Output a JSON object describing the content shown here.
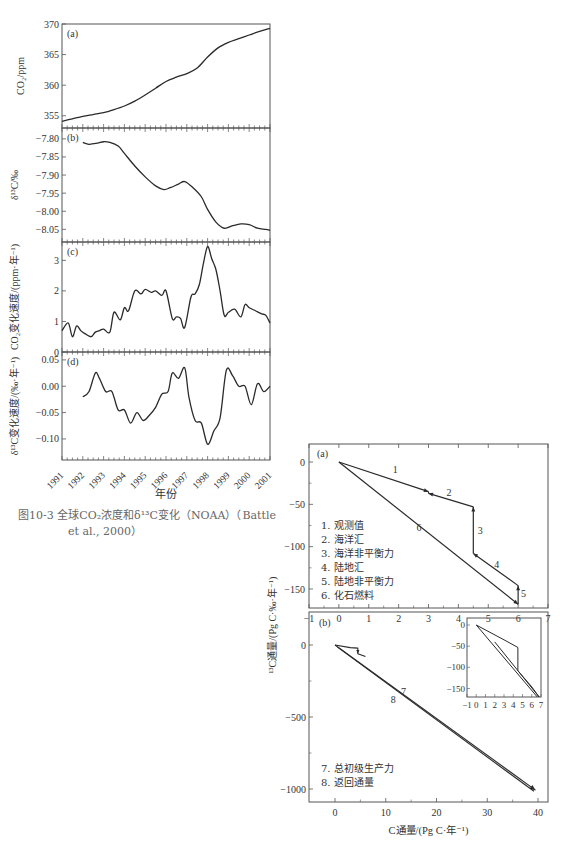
{
  "figure_caption": {
    "line1": "图10-3  全球CO₂浓度和δ¹³C变化（NOAA）（Battle",
    "line2": "et al., 2000）"
  },
  "chart_data": [
    {
      "id": "left-a",
      "type": "line",
      "panel_label": "(a)",
      "ylabel": "CO₂/ppm",
      "yticks": [
        355,
        360,
        365,
        370
      ],
      "ylim": [
        353,
        370
      ],
      "x": [
        1991.0,
        1991.5,
        1992.0,
        1992.5,
        1993.0,
        1993.5,
        1994.0,
        1994.5,
        1995.0,
        1995.5,
        1996.0,
        1996.5,
        1997.0,
        1997.5,
        1998.0,
        1998.5,
        1999.0,
        1999.5,
        2000.0,
        2000.5,
        2001.0
      ],
      "values": [
        354.1,
        354.5,
        354.9,
        355.2,
        355.5,
        356.0,
        356.6,
        357.4,
        358.4,
        359.5,
        360.6,
        361.3,
        361.9,
        362.8,
        364.6,
        366.1,
        367.0,
        367.6,
        368.2,
        368.8,
        369.3
      ]
    },
    {
      "id": "left-b",
      "type": "line",
      "panel_label": "(b)",
      "ylabel": "δ¹³C/‰",
      "yticks": [
        -7.8,
        -7.85,
        -7.9,
        -7.95,
        -8.0,
        -8.05
      ],
      "ylim": [
        -8.085,
        -7.77
      ],
      "x": [
        1992.0,
        1992.3,
        1992.7,
        1993.0,
        1993.3,
        1993.7,
        1994.0,
        1994.5,
        1995.0,
        1995.5,
        1995.9,
        1996.2,
        1996.6,
        1996.9,
        1997.3,
        1997.7,
        1998.0,
        1998.4,
        1998.8,
        1999.2,
        1999.6,
        2000.0,
        2000.4,
        2000.8,
        2001.0
      ],
      "values": [
        -7.81,
        -7.815,
        -7.812,
        -7.808,
        -7.81,
        -7.82,
        -7.84,
        -7.875,
        -7.905,
        -7.93,
        -7.94,
        -7.935,
        -7.925,
        -7.918,
        -7.935,
        -7.96,
        -7.995,
        -8.03,
        -8.047,
        -8.04,
        -8.035,
        -8.037,
        -8.047,
        -8.05,
        -8.053
      ]
    },
    {
      "id": "left-c",
      "type": "line",
      "panel_label": "(c)",
      "ylabel": "CO₂变化速度/(ppm·年⁻¹)",
      "yticks": [
        0,
        1,
        2,
        3
      ],
      "ylim": [
        0,
        3.6
      ],
      "x": [
        1991.0,
        1991.3,
        1991.5,
        1991.7,
        1991.9,
        1992.1,
        1992.4,
        1992.6,
        1992.8,
        1993.0,
        1993.3,
        1993.5,
        1993.8,
        1994.0,
        1994.2,
        1994.5,
        1994.8,
        1995.0,
        1995.3,
        1995.5,
        1995.8,
        1996.0,
        1996.3,
        1996.5,
        1996.7,
        1996.9,
        1997.2,
        1997.4,
        1997.6,
        1997.8,
        1998.0,
        1998.2,
        1998.4,
        1998.6,
        1998.8,
        1999.0,
        1999.3,
        1999.6,
        1999.8,
        2000.0,
        2000.3,
        2000.6,
        2000.8,
        2001.0
      ],
      "values": [
        0.7,
        0.95,
        0.5,
        0.85,
        0.7,
        0.6,
        0.5,
        0.65,
        0.7,
        0.75,
        0.65,
        1.3,
        1.05,
        1.45,
        1.35,
        2.0,
        1.9,
        2.05,
        1.95,
        2.0,
        1.85,
        2.0,
        1.1,
        1.15,
        1.1,
        0.8,
        1.8,
        1.9,
        2.2,
        2.9,
        3.45,
        3.05,
        2.7,
        2.0,
        1.2,
        1.3,
        1.4,
        1.15,
        1.55,
        1.45,
        1.35,
        1.25,
        1.2,
        0.95
      ]
    },
    {
      "id": "left-d",
      "type": "line",
      "panel_label": "(d)",
      "ylabel": "δ¹³C变化速度/(‰·年⁻¹)",
      "xlabel": "年份",
      "yticks": [
        0.05,
        0.0,
        -0.05,
        -0.1
      ],
      "ylim": [
        -0.14,
        0.065
      ],
      "xticks": [
        "1991",
        "1992",
        "1993",
        "1994",
        "1995",
        "1996",
        "1997",
        "1998",
        "1999",
        "2000",
        "2001"
      ],
      "x": [
        1992.0,
        1992.3,
        1992.6,
        1992.8,
        1993.1,
        1993.4,
        1993.7,
        1994.0,
        1994.3,
        1994.6,
        1994.9,
        1995.2,
        1995.5,
        1995.8,
        1996.1,
        1996.3,
        1996.6,
        1996.9,
        1997.1,
        1997.4,
        1997.7,
        1998.0,
        1998.3,
        1998.6,
        1998.9,
        1999.2,
        1999.5,
        1999.8,
        2000.1,
        2000.4,
        2000.7,
        2001.0
      ],
      "values": [
        -0.02,
        -0.01,
        0.025,
        0.015,
        -0.01,
        -0.01,
        -0.045,
        -0.045,
        -0.07,
        -0.05,
        -0.065,
        -0.055,
        -0.04,
        -0.015,
        -0.01,
        0.025,
        0.015,
        0.035,
        -0.02,
        -0.065,
        -0.07,
        -0.11,
        -0.085,
        -0.06,
        0.03,
        0.02,
        0.0,
        0.0,
        -0.035,
        0.005,
        -0.01,
        0.0
      ]
    },
    {
      "id": "right-a",
      "type": "line",
      "panel_label": "(a)",
      "xticks": [
        -1,
        0,
        1,
        2,
        3,
        4,
        5,
        6,
        7
      ],
      "yticks": [
        0,
        -50,
        -100,
        -150
      ],
      "xlim": [
        -1,
        7
      ],
      "ylim": [
        -175,
        20
      ],
      "legend": [
        "1. 观测值",
        "2. 海洋汇",
        "3. 海洋非平衡力",
        "4. 陆地汇",
        "5. 陆地非平衡力",
        "6. 化石燃料"
      ],
      "series": [
        {
          "name": "1",
          "points": [
            [
              0,
              0
            ],
            [
              3,
              -35
            ]
          ]
        },
        {
          "name": "2",
          "points": [
            [
              4.5,
              -53
            ],
            [
              3,
              -37
            ]
          ]
        },
        {
          "name": "3",
          "points": [
            [
              4.5,
              -108
            ],
            [
              4.5,
              -53
            ]
          ]
        },
        {
          "name": "4",
          "points": [
            [
              6,
              -146
            ],
            [
              4.5,
              -108
            ]
          ]
        },
        {
          "name": "5",
          "points": [
            [
              6,
              -168
            ],
            [
              6,
              -146
            ]
          ]
        },
        {
          "name": "6",
          "points": [
            [
              0,
              0
            ],
            [
              6,
              -168
            ]
          ]
        }
      ],
      "line_labels": [
        {
          "t": "1",
          "x": 1.8,
          "y": -13
        },
        {
          "t": "2",
          "x": 3.6,
          "y": -40
        },
        {
          "t": "3",
          "x": 4.65,
          "y": -85
        },
        {
          "t": "4",
          "x": 5.2,
          "y": -125
        },
        {
          "t": "5",
          "x": 6.1,
          "y": -160
        },
        {
          "t": "6",
          "x": 2.6,
          "y": -82
        }
      ]
    },
    {
      "id": "right-b",
      "type": "line",
      "panel_label": "(b)",
      "xlabel": "C通量/(Pg C·年⁻¹)",
      "ylabel": "¹³C通量/(Pg C·‰·年⁻¹)",
      "xticks": [
        0,
        10,
        20,
        30,
        40
      ],
      "yticks": [
        0,
        -500,
        -1000
      ],
      "xlim": [
        -5,
        41
      ],
      "ylim": [
        -1080,
        60
      ],
      "legend": [
        "7. 总初级生产力",
        "8. 返回通量"
      ],
      "series": [
        {
          "name": "7",
          "points": [
            [
              0,
              0
            ],
            [
              39.5,
              -1010
            ]
          ]
        },
        {
          "name": "8",
          "points": [
            [
              39.5,
              -1035
            ],
            [
              0,
              -20
            ]
          ]
        }
      ],
      "line_labels": [
        {
          "t": "7",
          "x": 13,
          "y": -345
        },
        {
          "t": "8",
          "x": 11,
          "y": -400
        }
      ],
      "inset": {
        "xticks": [
          -1,
          0,
          1,
          2,
          3,
          4,
          5,
          6,
          7
        ],
        "yticks": [
          0,
          -50,
          -100,
          -150
        ]
      }
    }
  ]
}
